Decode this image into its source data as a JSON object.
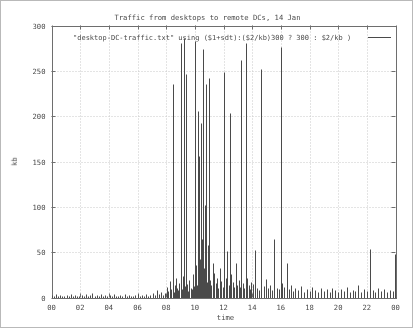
{
  "chart_data": {
    "type": "bar",
    "title": "Traffic from desktops to remote DCs, 14 Jan",
    "subtitle": "",
    "xlabel": "time",
    "ylabel": "kb",
    "xlim": [
      0,
      24
    ],
    "ylim": [
      0,
      300
    ],
    "grid": true,
    "legend_position": "top-inside",
    "legend": [
      "\"desktop-DC-traffic.txt\" using ($1+sdt):($2/kb)300 ? 300 : $2/kb )"
    ],
    "series_color": "#4a4a4a",
    "xticks": [
      "00",
      "02",
      "04",
      "06",
      "08",
      "10",
      "12",
      "14",
      "16",
      "18",
      "20",
      "22",
      "00"
    ],
    "xtick_values": [
      0,
      2,
      4,
      6,
      8,
      10,
      12,
      14,
      16,
      18,
      20,
      22,
      24
    ],
    "yticks": [
      "0",
      "50",
      "100",
      "150",
      "200",
      "250",
      "300"
    ],
    "ytick_values": [
      0,
      50,
      100,
      150,
      200,
      250,
      300
    ],
    "note": "impulse style plot; values clipped at 300 kb",
    "x": [
      0.05,
      0.15,
      0.3,
      0.45,
      0.6,
      0.75,
      0.9,
      1.05,
      1.2,
      1.35,
      1.5,
      1.65,
      1.8,
      1.95,
      2.1,
      2.25,
      2.4,
      2.55,
      2.7,
      2.85,
      3.0,
      3.15,
      3.3,
      3.45,
      3.6,
      3.75,
      3.9,
      4.05,
      4.2,
      4.35,
      4.5,
      4.65,
      4.8,
      4.95,
      5.1,
      5.25,
      5.4,
      5.55,
      5.7,
      5.85,
      6.0,
      6.15,
      6.3,
      6.45,
      6.6,
      6.75,
      6.9,
      7.05,
      7.2,
      7.35,
      7.5,
      7.65,
      7.8,
      7.95,
      8.05,
      8.15,
      8.25,
      8.35,
      8.45,
      8.55,
      8.62,
      8.7,
      8.78,
      8.85,
      8.92,
      9.0,
      9.05,
      9.1,
      9.18,
      9.25,
      9.32,
      9.4,
      9.48,
      9.55,
      9.62,
      9.7,
      9.78,
      9.85,
      9.92,
      10.0,
      10.05,
      10.1,
      10.15,
      10.2,
      10.25,
      10.3,
      10.35,
      10.4,
      10.45,
      10.5,
      10.55,
      10.6,
      10.65,
      10.7,
      10.75,
      10.8,
      10.85,
      10.9,
      10.95,
      11.0,
      11.08,
      11.15,
      11.25,
      11.35,
      11.45,
      11.55,
      11.65,
      11.75,
      11.85,
      11.95,
      12.05,
      12.15,
      12.25,
      12.35,
      12.45,
      12.55,
      12.65,
      12.75,
      12.85,
      12.95,
      13.05,
      13.15,
      13.25,
      13.35,
      13.45,
      13.55,
      13.65,
      13.75,
      13.85,
      13.95,
      14.05,
      14.2,
      14.35,
      14.5,
      14.65,
      14.8,
      14.95,
      15.1,
      15.25,
      15.4,
      15.55,
      15.7,
      15.85,
      16.0,
      16.1,
      16.25,
      16.4,
      16.55,
      16.7,
      16.85,
      17.0,
      17.2,
      17.4,
      17.6,
      17.8,
      18.0,
      18.2,
      18.4,
      18.6,
      18.8,
      19.0,
      19.2,
      19.4,
      19.6,
      19.8,
      20.0,
      20.2,
      20.4,
      20.6,
      20.8,
      21.0,
      21.2,
      21.4,
      21.6,
      21.8,
      22.0,
      22.2,
      22.4,
      22.6,
      22.8,
      23.0,
      23.2,
      23.4,
      23.6,
      23.8,
      23.95
    ],
    "y": [
      3,
      2,
      4,
      2,
      3,
      2,
      2,
      3,
      2,
      4,
      2,
      3,
      2,
      2,
      3,
      2,
      4,
      2,
      3,
      5,
      2,
      3,
      2,
      4,
      2,
      3,
      2,
      3,
      2,
      4,
      2,
      2,
      3,
      2,
      4,
      2,
      3,
      2,
      2,
      3,
      4,
      2,
      3,
      2,
      4,
      2,
      3,
      5,
      3,
      8,
      4,
      6,
      3,
      5,
      12,
      7,
      18,
      9,
      235,
      6,
      14,
      22,
      10,
      8,
      16,
      281,
      11,
      9,
      24,
      286,
      13,
      246,
      15,
      7,
      19,
      11,
      9,
      26,
      13,
      283,
      18,
      36,
      14,
      206,
      24,
      156,
      42,
      192,
      28,
      64,
      48,
      274,
      33,
      102,
      21,
      236,
      17,
      58,
      24,
      242,
      19,
      14,
      38,
      27,
      16,
      22,
      11,
      33,
      18,
      12,
      249,
      21,
      51,
      14,
      203,
      26,
      17,
      12,
      38,
      14,
      19,
      12,
      262,
      16,
      11,
      281,
      21,
      14,
      9,
      17,
      15,
      52,
      11,
      8,
      252,
      13,
      20,
      10,
      14,
      8,
      64,
      11,
      9,
      276,
      16,
      12,
      38,
      9,
      14,
      7,
      11,
      8,
      13,
      6,
      9,
      7,
      12,
      8,
      6,
      10,
      7,
      9,
      6,
      11,
      8,
      6,
      9,
      7,
      12,
      6,
      8,
      7,
      14,
      6,
      9,
      7,
      53,
      8,
      6,
      11,
      7,
      9,
      6,
      8,
      7,
      48
    ]
  }
}
